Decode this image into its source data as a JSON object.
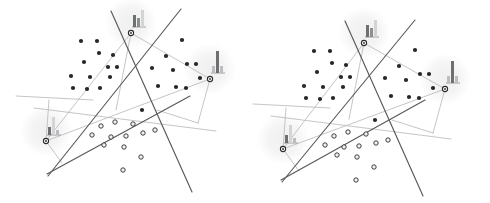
{
  "figure": {
    "panel_count": 2,
    "background_color": "#ffffff",
    "colors": {
      "cut_line": "#58595b",
      "graph_edge": "#b9babc",
      "point_filled": "#262626",
      "point_ring_fill": "#f2f2f2",
      "point_ring_stroke": "#2b2b2b",
      "hub_node_fill": "#ffffff",
      "hub_node_stroke": "#2b2b2b",
      "halo": "#efefef",
      "bar_dark": "#6e6f71",
      "bar_mid": "#8d8e90",
      "bar_light": "#bcbdbf",
      "bar_pale": "#d3d4d6"
    },
    "panels": [
      {
        "id": "panel-left",
        "label": "left-panel",
        "width": 245,
        "height": 203,
        "cut_lines": [
          {
            "name": "cut-line-a",
            "x1": 111,
            "y1": 11,
            "x2": 192,
            "y2": 192
          },
          {
            "name": "cut-line-b",
            "x1": 181,
            "y1": 9,
            "x2": 48,
            "y2": 176
          },
          {
            "name": "cut-line-c",
            "x1": 47,
            "y1": 174,
            "x2": 190,
            "y2": 96
          }
        ],
        "graph_edges": [
          {
            "name": "edge-hubtop-hubright",
            "x1": 131,
            "y1": 33,
            "x2": 210,
            "y2": 79
          },
          {
            "name": "edge-hubtop-hubleft",
            "x1": 131,
            "y1": 33,
            "x2": 46,
            "y2": 141
          },
          {
            "name": "edge-hubleft-hubright",
            "x1": 46,
            "y1": 141,
            "x2": 210,
            "y2": 79
          },
          {
            "name": "edge-hubtop-elbow",
            "x1": 131,
            "y1": 33,
            "x2": 116,
            "y2": 110
          },
          {
            "name": "edge-hubleft-bracket",
            "x1": 46,
            "y1": 141,
            "x2": 49,
            "y2": 100
          },
          {
            "name": "edge-bracket-top",
            "x1": 16,
            "y1": 96,
            "x2": 93,
            "y2": 100
          },
          {
            "name": "edge-hubleft-spur",
            "x1": 46,
            "y1": 141,
            "x2": 62,
            "y2": 163
          },
          {
            "name": "edge-hubright-drop",
            "x1": 210,
            "y1": 79,
            "x2": 198,
            "y2": 123
          },
          {
            "name": "edge-sweep",
            "x1": 34,
            "y1": 108,
            "x2": 216,
            "y2": 131
          },
          {
            "name": "edge-hubright-bracket",
            "x1": 198,
            "y1": 123,
            "x2": 157,
            "y2": 110
          }
        ],
        "hubs": [
          {
            "name": "hub-top",
            "x": 131,
            "y": 33,
            "icon": "histogram-icon-descending",
            "halo_r": 26
          },
          {
            "name": "hub-right",
            "x": 210,
            "y": 79,
            "icon": "histogram-icon-tall-center",
            "halo_r": 26
          },
          {
            "name": "hub-left",
            "x": 46,
            "y": 141,
            "icon": "histogram-icon-peak-left",
            "halo_r": 26
          }
        ],
        "clusters": [
          {
            "name": "cluster-upper-left",
            "marker": "filled",
            "count": 13,
            "points": [
              [
                81,
                41
              ],
              [
                97,
                41
              ],
              [
                99,
                53
              ],
              [
                113,
                55
              ],
              [
                84,
                62
              ],
              [
                108,
                67
              ],
              [
                71,
                76
              ],
              [
                90,
                77
              ],
              [
                110,
                77
              ],
              [
                73,
                88
              ],
              [
                87,
                89
              ],
              [
                100,
                88
              ],
              [
                117,
                67
              ]
            ]
          },
          {
            "name": "cluster-right",
            "marker": "filled",
            "count": 11,
            "points": [
              [
                166,
                56
              ],
              [
                182,
                40
              ],
              [
                152,
                68
              ],
              [
                173,
                70
              ],
              [
                187,
                64
              ],
              [
                158,
                86
              ],
              [
                176,
                87
              ],
              [
                186,
                88
              ],
              [
                200,
                78
              ],
              [
                142,
                110
              ],
              [
                196,
                64
              ]
            ]
          },
          {
            "name": "cluster-lower",
            "marker": "ring",
            "count": 12,
            "points": [
              [
                101,
                126
              ],
              [
                115,
                122
              ],
              [
                133,
                124
              ],
              [
                92,
                135
              ],
              [
                111,
                137
              ],
              [
                126,
                136
              ],
              [
                143,
                133
              ],
              [
                155,
                130
              ],
              [
                104,
                145
              ],
              [
                124,
                147
              ],
              [
                141,
                157
              ],
              [
                123,
                170
              ]
            ]
          }
        ]
      },
      {
        "id": "panel-right",
        "label": "right-panel",
        "width": 245,
        "height": 203,
        "cut_lines": [
          {
            "name": "cut-line-a",
            "x1": 100,
            "y1": 21,
            "x2": 178,
            "y2": 196
          },
          {
            "name": "cut-line-b",
            "x1": 170,
            "y1": 20,
            "x2": 37,
            "y2": 182
          },
          {
            "name": "cut-line-c",
            "x1": 36,
            "y1": 180,
            "x2": 180,
            "y2": 100
          }
        ],
        "graph_edges": [
          {
            "name": "edge-hubtop-hubright",
            "x1": 119,
            "y1": 43,
            "x2": 200,
            "y2": 89
          },
          {
            "name": "edge-hubtop-hubleft",
            "x1": 119,
            "y1": 43,
            "x2": 38,
            "y2": 149
          },
          {
            "name": "edge-hubleft-hubright",
            "x1": 38,
            "y1": 149,
            "x2": 200,
            "y2": 89
          },
          {
            "name": "edge-hubtop-elbow",
            "x1": 119,
            "y1": 43,
            "x2": 104,
            "y2": 119
          },
          {
            "name": "edge-hubleft-bracket",
            "x1": 38,
            "y1": 149,
            "x2": 41,
            "y2": 108
          },
          {
            "name": "edge-bracket-top",
            "x1": 8,
            "y1": 104,
            "x2": 85,
            "y2": 108
          },
          {
            "name": "edge-hubleft-spur",
            "x1": 38,
            "y1": 149,
            "x2": 54,
            "y2": 171
          },
          {
            "name": "edge-hubright-drop",
            "x1": 200,
            "y1": 89,
            "x2": 188,
            "y2": 133
          },
          {
            "name": "edge-sweep",
            "x1": 26,
            "y1": 116,
            "x2": 206,
            "y2": 139
          },
          {
            "name": "edge-hubright-bracket",
            "x1": 188,
            "y1": 133,
            "x2": 147,
            "y2": 120
          }
        ],
        "hubs": [
          {
            "name": "hub-top",
            "x": 119,
            "y": 43,
            "icon": "histogram-icon-descending",
            "halo_r": 26
          },
          {
            "name": "hub-right",
            "x": 200,
            "y": 89,
            "icon": "histogram-icon-tall-center",
            "halo_r": 26
          },
          {
            "name": "hub-left",
            "x": 38,
            "y": 149,
            "icon": "histogram-icon-peak-left",
            "halo_r": 26
          }
        ],
        "clusters": [
          {
            "name": "cluster-upper-left",
            "marker": "filled",
            "count": 13,
            "points": [
              [
                69,
                51
              ],
              [
                85,
                51
              ],
              [
                87,
                63
              ],
              [
                101,
                65
              ],
              [
                72,
                72
              ],
              [
                96,
                77
              ],
              [
                59,
                86
              ],
              [
                78,
                87
              ],
              [
                98,
                87
              ],
              [
                61,
                98
              ],
              [
                75,
                99
              ],
              [
                88,
                98
              ],
              [
                105,
                77
              ]
            ]
          },
          {
            "name": "cluster-right",
            "marker": "filled",
            "count": 11,
            "points": [
              [
                154,
                66
              ],
              [
                170,
                50
              ],
              [
                140,
                78
              ],
              [
                161,
                80
              ],
              [
                175,
                74
              ],
              [
                146,
                96
              ],
              [
                164,
                97
              ],
              [
                174,
                98
              ],
              [
                188,
                88
              ],
              [
                130,
                120
              ],
              [
                184,
                74
              ]
            ]
          },
          {
            "name": "cluster-lower",
            "marker": "ring",
            "count": 12,
            "points": [
              [
                89,
                136
              ],
              [
                103,
                132
              ],
              [
                121,
                134
              ],
              [
                80,
                145
              ],
              [
                99,
                147
              ],
              [
                114,
                146
              ],
              [
                131,
                143
              ],
              [
                143,
                140
              ],
              [
                92,
                155
              ],
              [
                112,
                157
              ],
              [
                129,
                167
              ],
              [
                111,
                180
              ]
            ]
          }
        ]
      }
    ],
    "icons": {
      "histogram-icon-descending": {
        "label": "histogram-icon-descending",
        "description": "small bar chart with two tall bars on the left and a taller light bar on the right",
        "bars": [
          {
            "x": 0,
            "h": 12,
            "w": 3,
            "tone": "bar-dark"
          },
          {
            "x": 4,
            "h": 9,
            "w": 3,
            "tone": "bar-mid"
          },
          {
            "x": 8,
            "h": 17,
            "w": 3,
            "tone": "bar-pale"
          }
        ]
      },
      "histogram-icon-tall-center": {
        "label": "histogram-icon-tall-center",
        "description": "small bar chart with one tall dark bar flanked by shorter light bars",
        "bars": [
          {
            "x": 0,
            "h": 7,
            "w": 3,
            "tone": "bar-light"
          },
          {
            "x": 4,
            "h": 22,
            "w": 3,
            "tone": "bar-dark"
          },
          {
            "x": 8,
            "h": 7,
            "w": 3,
            "tone": "bar-light"
          }
        ]
      },
      "histogram-icon-peak-left": {
        "label": "histogram-icon-peak-left",
        "description": "small bar chart with a short dark bar left and a tall pale bar right",
        "bars": [
          {
            "x": 0,
            "h": 8,
            "w": 3,
            "tone": "bar-dark"
          },
          {
            "x": 4,
            "h": 18,
            "w": 3,
            "tone": "bar-pale"
          },
          {
            "x": 8,
            "h": 5,
            "w": 3,
            "tone": "bar-light"
          }
        ]
      }
    }
  }
}
